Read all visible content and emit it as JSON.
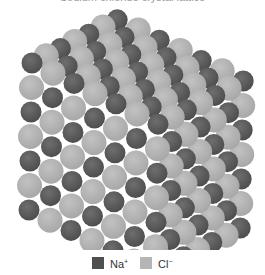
{
  "figure": {
    "title_clipped": "Sodium chloride crystal lattice"
  },
  "lattice": {
    "n": 7,
    "origin": [
      32,
      63
    ],
    "step_row": [
      -0.5,
      24.5
    ],
    "step_col": [
      21,
      10.2
    ],
    "step_depth": [
      14.2,
      -7.2
    ],
    "ions": {
      "na": {
        "color": "#5a5a5a",
        "highlight": "#707070",
        "radius": 10.5
      },
      "cl": {
        "color": "#b3b3b3",
        "highlight": "#c4c4c4",
        "radius": 12.5
      }
    }
  },
  "legend": {
    "items": [
      {
        "key": "na",
        "symbol": "Na",
        "charge": "+",
        "color": "#4f4f4f",
        "x": 92
      },
      {
        "key": "cl",
        "symbol": "Cl",
        "charge": "−",
        "color": "#b5b5b5",
        "x": 140
      }
    ]
  }
}
